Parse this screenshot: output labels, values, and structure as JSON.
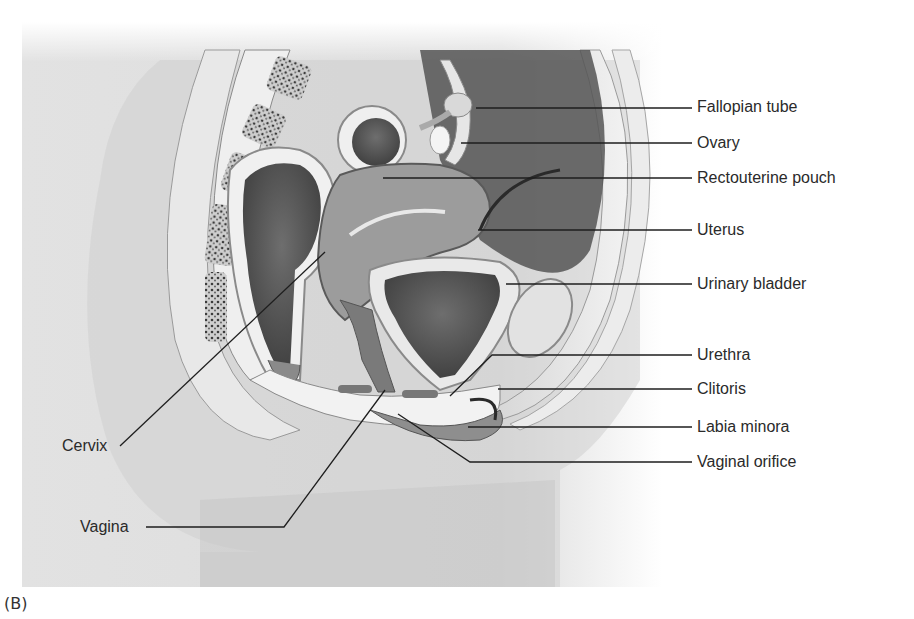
{
  "figure": {
    "caption": "(B)",
    "colors": {
      "background": "#ffffff",
      "panel": "#e6e6e6",
      "tissue_dark": "#5e5e5e",
      "tissue_mid": "#8c8c8c",
      "tissue_light": "#d9d9d9",
      "leader_line": "#1e1e1e",
      "label_text": "#2a2a2a"
    }
  },
  "labels": {
    "right": [
      {
        "id": "fallopian-tube",
        "text": "Fallopian tube",
        "x": 697,
        "y": 124,
        "line": [
          [
            476,
            108
          ],
          [
            692,
            132
          ]
        ]
      },
      {
        "id": "ovary",
        "text": "Ovary",
        "x": 697,
        "y": 152,
        "line": [
          [
            461,
            143
          ],
          [
            692,
            143
          ]
        ]
      },
      {
        "id": "rectouterine-pouch",
        "text": "Rectouterine pouch",
        "x": 697,
        "y": 167,
        "line": [
          [
            383,
            177
          ],
          [
            692,
            177
          ]
        ]
      },
      {
        "id": "uterus",
        "text": "Uterus",
        "x": 697,
        "y": 220,
        "line": [
          [
            478,
            230
          ],
          [
            692,
            230
          ]
        ]
      },
      {
        "id": "urinary-bladder",
        "text": "Urinary bladder",
        "x": 697,
        "y": 273,
        "line": [
          [
            506,
            284
          ],
          [
            692,
            284
          ]
        ]
      },
      {
        "id": "urethra",
        "text": "Urethra",
        "x": 697,
        "y": 344,
        "line": [
          [
            450,
            396
          ],
          [
            492,
            355
          ],
          [
            692,
            355
          ]
        ]
      },
      {
        "id": "clitoris",
        "text": "Clitoris",
        "x": 697,
        "y": 375,
        "line": [
          [
            498,
            389
          ],
          [
            692,
            389
          ]
        ]
      },
      {
        "id": "labia-minora",
        "text": "Labia minora",
        "x": 697,
        "y": 414,
        "line": [
          [
            468,
            427
          ],
          [
            692,
            427
          ]
        ]
      },
      {
        "id": "vaginal-orifice",
        "text": "Vaginal orifice",
        "x": 697,
        "y": 449,
        "line": [
          [
            398,
            414
          ],
          [
            470,
            462
          ],
          [
            692,
            462
          ]
        ]
      }
    ],
    "left": [
      {
        "id": "cervix",
        "text": "Cervix",
        "x": 62,
        "y": 439,
        "line": [
          [
            120,
            446
          ],
          [
            325,
            252
          ]
        ]
      },
      {
        "id": "vagina",
        "text": "Vagina",
        "x": 80,
        "y": 508,
        "line": [
          [
            146,
            527
          ],
          [
            284,
            527
          ],
          [
            385,
            390
          ]
        ]
      }
    ]
  }
}
